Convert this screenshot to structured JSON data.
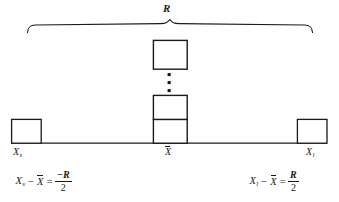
{
  "figure": {
    "type": "statistical-range-diagram",
    "background_color": "#ffffff",
    "ink_color": "#1a1a1a",
    "range_brace": {
      "label": "R",
      "meaning": "range",
      "span_start_x": 27,
      "span_end_x": 313,
      "peak_x": 170
    },
    "axis": {
      "baseline_y": 143,
      "start_x": 11,
      "end_x": 327,
      "points": [
        {
          "id": "smallest",
          "label_variable": "X",
          "label_subscript": "s",
          "x": 26
        },
        {
          "id": "mean",
          "label_variable": "X",
          "label_subscript": "",
          "overbar": true,
          "x": 170
        },
        {
          "id": "largest",
          "label_variable": "X",
          "label_subscript": "l",
          "x": 312
        }
      ]
    },
    "boxes": [
      {
        "id": "box-left",
        "x": 11,
        "y": 119,
        "width": 30,
        "height": 24
      },
      {
        "id": "box-center-bottom",
        "x": 153,
        "y": 119,
        "width": 34,
        "height": 24
      },
      {
        "id": "box-center-middle",
        "x": 153,
        "y": 95,
        "width": 34,
        "height": 24
      },
      {
        "id": "box-center-top",
        "x": 153,
        "y": 40,
        "width": 34,
        "height": 29
      },
      {
        "id": "box-right",
        "x": 297,
        "y": 119,
        "width": 30,
        "height": 24
      }
    ],
    "ellipsis": {
      "orientation": "vertical",
      "dot_count": 3,
      "x": 169,
      "dots_y": [
        74,
        82,
        90
      ]
    }
  },
  "labels": {
    "range": "R",
    "smallest_point": {
      "variable": "X",
      "subscript": "s"
    },
    "mean_point": {
      "variable": "X",
      "subscript": ""
    },
    "largest_point": {
      "variable": "X",
      "subscript": "l"
    }
  },
  "equations": {
    "left": {
      "term_variable": "X",
      "term_subscript": "s",
      "minus": "−",
      "mean_variable": "X",
      "equals": "=",
      "numerator": "−R",
      "denominator": "2",
      "plain_text": "Xₛ − X̄ = −R/2"
    },
    "right": {
      "term_variable": "X",
      "term_subscript": "l",
      "minus": "−",
      "mean_variable": "X",
      "equals": "=",
      "numerator": "R",
      "denominator": "2",
      "plain_text": "Xₗ − X̄ = R/2"
    }
  }
}
